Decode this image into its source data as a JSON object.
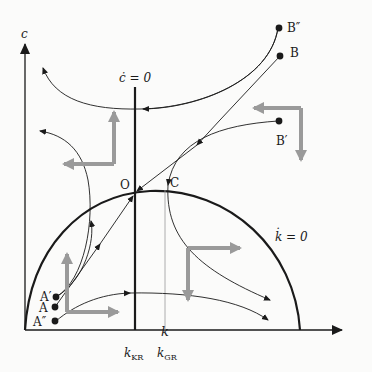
{
  "diagram": {
    "type": "phase-diagram",
    "axes": {
      "x_label": "k",
      "y_label": "c"
    },
    "loci": {
      "c_dot_zero": "ċ = 0",
      "k_dot_zero": "k̇ = 0"
    },
    "x_ticks": {
      "k_kr": {
        "base": "k",
        "sub": "KR"
      },
      "k_gr": {
        "base": "k",
        "sub": "GR"
      }
    },
    "points": {
      "O": "O",
      "C": "C",
      "B_double_prime": "B″",
      "B": "B",
      "B_prime": "B′",
      "A_prime": "A′",
      "A": "A",
      "A_double_prime": "A″"
    },
    "colors": {
      "line": "#1a1a1a",
      "direction_arrow": "#9a9a9a",
      "background": "#fbfbfa"
    }
  }
}
